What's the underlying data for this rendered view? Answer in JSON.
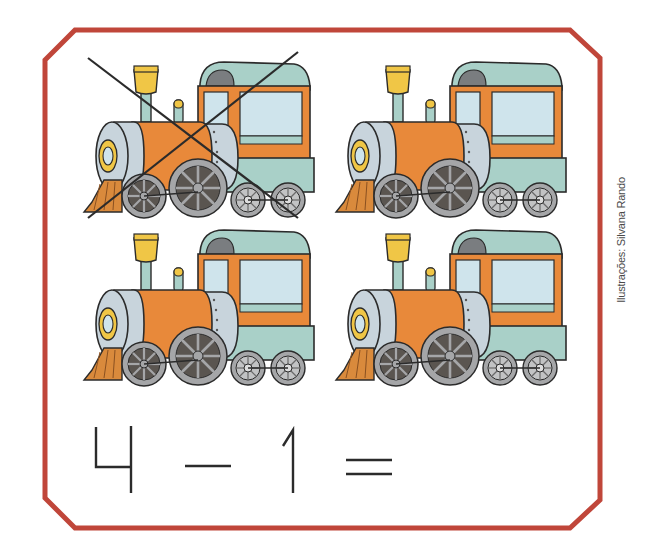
{
  "exercise": {
    "frame_color": "#c0463a",
    "item_count": 4,
    "crossed_out_count": 1,
    "item_name": "steam locomotive",
    "items": [
      {
        "id": 1,
        "crossed_out": true
      },
      {
        "id": 2,
        "crossed_out": false
      },
      {
        "id": 3,
        "crossed_out": false
      },
      {
        "id": 4,
        "crossed_out": false
      }
    ],
    "equation": {
      "operand_a": "4",
      "operator": "−",
      "operand_b": "1",
      "equals": "=",
      "answer": ""
    }
  },
  "credit": "Ilustrações: Silvana Rando",
  "colors": {
    "orange": "#e8893a",
    "pale_blue": "#cfe4ec",
    "teal": "#a9d0c8",
    "steel": "#c8d4dc",
    "yellow": "#f0c646",
    "wheel_dark": "#5a5550",
    "wheel_gray": "#a5a6a8",
    "cowcatcher": "#d98a3c",
    "outline": "#2b2b2b"
  }
}
